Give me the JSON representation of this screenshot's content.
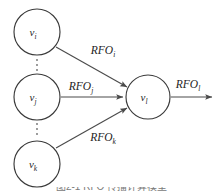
{
  "figure": {
    "type": "node-aggregation-diagram",
    "caption": "图2-1 RFO 传播计算模型",
    "nodes": [
      {
        "id": "source-top",
        "base": "v",
        "sub": "i",
        "cx": 37,
        "cy": 32,
        "r": 23
      },
      {
        "id": "source-middle",
        "base": "v",
        "sub": "j",
        "cx": 37,
        "cy": 97,
        "r": 23
      },
      {
        "id": "source-bottom",
        "base": "v",
        "sub": "k",
        "cx": 37,
        "cy": 164,
        "r": 23
      },
      {
        "id": "target-center",
        "base": "v",
        "sub": "l",
        "cx": 148,
        "cy": 97,
        "r": 22
      }
    ],
    "edges": [
      {
        "id": "edge-top",
        "base": "RFO",
        "sub": "i",
        "lx": 103,
        "ly": 54,
        "from": "source-top",
        "to": "target-center"
      },
      {
        "id": "edge-middle",
        "base": "RFO",
        "sub": "j",
        "lx": 81,
        "ly": 90,
        "from": "source-middle",
        "to": "target-center"
      },
      {
        "id": "edge-bottom",
        "base": "RFO",
        "sub": "k",
        "lx": 103,
        "ly": 141,
        "from": "source-bottom",
        "to": "target-center"
      },
      {
        "id": "edge-output",
        "base": "RFO",
        "sub": "l",
        "lx": 180,
        "ly": 88,
        "from": "target-center",
        "to": "output"
      }
    ],
    "ellipses": [
      {
        "id": "ellipsis-upper",
        "cx": 37,
        "cy": 66,
        "dots": 3
      },
      {
        "id": "ellipsis-lower",
        "cx": 37,
        "cy": 130,
        "dots": 3
      }
    ],
    "colors": {
      "stroke": "#3a3a3a",
      "edge": "#4a4a4a",
      "text": "#242424",
      "background": "#ffffff",
      "caption": "#7a7a7a"
    }
  }
}
